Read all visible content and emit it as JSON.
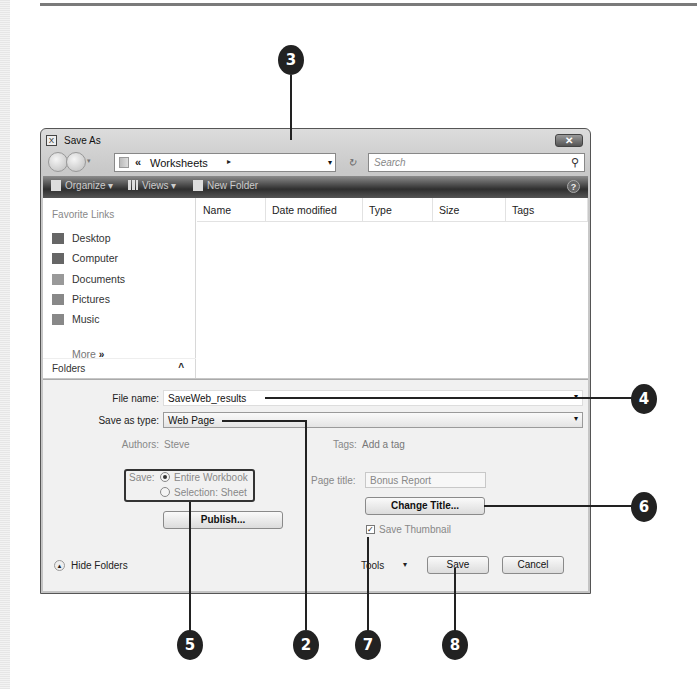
{
  "dialog": {
    "title": "Save As",
    "close_icon": "close-icon",
    "nav": {
      "address_prefix": "«",
      "address_folder": "Worksheets",
      "address_arrow": "▸",
      "address_dropdown": "▾",
      "refresh_glyph": "↻",
      "search_placeholder": "Search",
      "search_icon": "⚲"
    },
    "toolbar": {
      "organize": "Organize ▾",
      "views": "Views ▾",
      "new_folder": "New Folder",
      "help": "?"
    },
    "sidebar": {
      "favorite_links_title": "Favorite Links",
      "items": [
        {
          "label": "Desktop",
          "icon": "desktop-icon"
        },
        {
          "label": "Computer",
          "icon": "computer-icon"
        },
        {
          "label": "Documents",
          "icon": "documents-icon"
        },
        {
          "label": "Pictures",
          "icon": "pictures-icon"
        },
        {
          "label": "Music",
          "icon": "music-icon"
        }
      ],
      "more_label": "More",
      "more_glyph": "»",
      "folders_label": "Folders",
      "folders_caret": "^"
    },
    "file_list": {
      "columns": [
        "Name",
        "Date modified",
        "Type",
        "Size",
        "Tags"
      ]
    },
    "form": {
      "file_name_label": "File name:",
      "file_name_value": "SaveWeb_results",
      "save_as_type_label": "Save as type:",
      "save_as_type_value": "Web Page",
      "authors_label": "Authors:",
      "authors_value": "Steve",
      "tags_label": "Tags:",
      "tags_value": "Add a tag",
      "save_label": "Save:",
      "save_options": [
        {
          "label": "Entire Workbook",
          "selected": true
        },
        {
          "label": "Selection: Sheet",
          "selected": false
        }
      ],
      "publish_button": "Publish...",
      "page_title_label": "Page title:",
      "page_title_value": "Bonus Report",
      "change_title_button": "Change Title...",
      "save_thumbnail_label": "Save Thumbnail",
      "save_thumbnail_checked": true
    },
    "footer": {
      "hide_folders": "Hide Folders",
      "tools": "Tools",
      "tools_caret": "▾",
      "save_button": "Save",
      "cancel_button": "Cancel"
    }
  },
  "callouts": [
    "3",
    "4",
    "6",
    "5",
    "2",
    "7",
    "8"
  ]
}
